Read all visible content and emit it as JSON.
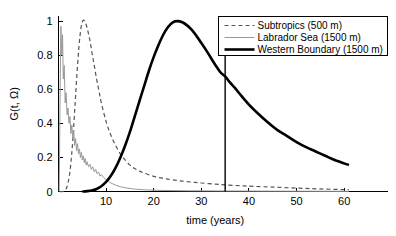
{
  "chart_data": {
    "type": "line",
    "title": "",
    "xlabel": "time (years)",
    "ylabel": "G(t, Ω)",
    "xlim": [
      0,
      65
    ],
    "ylim": [
      0,
      1.03
    ],
    "xticks": [
      10,
      20,
      30,
      40,
      50,
      60
    ],
    "xtick_labels": [
      "10",
      "20",
      "30",
      "40",
      "50",
      "60"
    ],
    "yticks": [
      0,
      0.2,
      0.4,
      0.6,
      0.8,
      1
    ],
    "ytick_labels": [
      "0",
      "0.2",
      "0.4",
      "0.6",
      "0.8",
      "1"
    ],
    "grid": false,
    "legend_position": "top-right",
    "annotations": [
      {
        "name": "vertical-marker",
        "type": "vline",
        "x": 35,
        "y_from": 0,
        "y_to": 1.03,
        "color": "#000000"
      }
    ],
    "series": [
      {
        "name": "Subtropics (500 m)",
        "style": "dashed",
        "color": "#555555",
        "width": 1.2,
        "x": [
          0.3,
          1.0,
          1.5,
          2.0,
          2.5,
          3.0,
          3.5,
          4.0,
          4.5,
          5.0,
          5.5,
          6.0,
          6.5,
          7.0,
          7.5,
          8.0,
          8.5,
          9.0,
          10.0,
          11.0,
          12.0,
          13.0,
          14.0,
          15.0,
          16.0,
          17.0,
          18.0,
          20.0,
          22.0,
          24.0,
          26.0,
          28.0,
          30.0,
          33.0,
          35.0,
          38.0,
          41.0,
          45.0,
          50.0,
          55.0,
          61.0
        ],
        "y": [
          0.0,
          0.0,
          0.01,
          0.05,
          0.14,
          0.3,
          0.52,
          0.74,
          0.91,
          0.995,
          1.0,
          0.96,
          0.9,
          0.82,
          0.74,
          0.66,
          0.59,
          0.52,
          0.41,
          0.33,
          0.27,
          0.22,
          0.185,
          0.155,
          0.135,
          0.12,
          0.108,
          0.089,
          0.077,
          0.068,
          0.061,
          0.055,
          0.05,
          0.043,
          0.039,
          0.034,
          0.03,
          0.026,
          0.02,
          0.015,
          0.01
        ]
      },
      {
        "name": "Labrador Sea (1500 m)",
        "style": "solid",
        "color": "#999999",
        "width": 1.0,
        "x": [
          0.15,
          0.35,
          0.5,
          0.7,
          0.85,
          1.0,
          1.2,
          1.4,
          1.6,
          1.8,
          2.0,
          2.2,
          2.4,
          2.6,
          2.8,
          3.0,
          3.2,
          3.4,
          3.6,
          3.8,
          4.0,
          4.2,
          4.4,
          4.6,
          4.8,
          5.0,
          5.2,
          5.4,
          5.6,
          5.8,
          6.0,
          6.3,
          6.6,
          6.9,
          7.2,
          7.5,
          7.8,
          8.1,
          8.4,
          8.7,
          9.0,
          9.5,
          10.0,
          10.5,
          11.0,
          12.0,
          13.0,
          14.0,
          16.0,
          18.0,
          22.0,
          28.0,
          35.0,
          45.0,
          61.0
        ],
        "y": [
          0.0,
          0.62,
          0.97,
          0.8,
          0.92,
          0.66,
          0.74,
          0.52,
          0.58,
          0.45,
          0.49,
          0.4,
          0.44,
          0.34,
          0.39,
          0.31,
          0.36,
          0.27,
          0.31,
          0.24,
          0.28,
          0.22,
          0.25,
          0.2,
          0.23,
          0.185,
          0.21,
          0.17,
          0.195,
          0.155,
          0.175,
          0.145,
          0.16,
          0.13,
          0.145,
          0.115,
          0.13,
          0.105,
          0.115,
          0.09,
          0.1,
          0.082,
          0.07,
          0.06,
          0.05,
          0.037,
          0.028,
          0.022,
          0.014,
          0.01,
          0.006,
          0.004,
          0.003,
          0.002,
          0.001
        ]
      },
      {
        "name": "Western Boundary (1500 m)",
        "style": "solid",
        "color": "#000000",
        "width": 2.6,
        "x": [
          5.0,
          6.0,
          7.0,
          8.0,
          9.0,
          10.0,
          11.0,
          12.0,
          13.0,
          14.0,
          15.0,
          16.0,
          17.0,
          18.0,
          19.0,
          20.0,
          21.0,
          22.0,
          23.0,
          24.0,
          25.0,
          26.0,
          27.0,
          28.0,
          29.0,
          30.0,
          31.0,
          32.0,
          33.0,
          34.0,
          35.0,
          36.0,
          37.0,
          38.0,
          40.0,
          42.0,
          44.0,
          46.0,
          48.0,
          50.0,
          52.0,
          54.0,
          56.0,
          58.0,
          61.0
        ],
        "y": [
          0.0,
          0.002,
          0.006,
          0.015,
          0.031,
          0.056,
          0.092,
          0.14,
          0.2,
          0.27,
          0.35,
          0.44,
          0.53,
          0.62,
          0.71,
          0.79,
          0.86,
          0.92,
          0.965,
          0.993,
          1.0,
          0.993,
          0.975,
          0.948,
          0.912,
          0.872,
          0.83,
          0.785,
          0.74,
          0.7,
          0.675,
          0.64,
          0.61,
          0.575,
          0.51,
          0.455,
          0.405,
          0.36,
          0.325,
          0.29,
          0.26,
          0.235,
          0.21,
          0.185,
          0.155
        ]
      }
    ]
  },
  "legend": {
    "items": [
      {
        "label": "Subtropics (500 m)",
        "swatch": "dashed-gray"
      },
      {
        "label": "Labrador Sea (1500 m)",
        "swatch": "solid-thin-gray"
      },
      {
        "label": "Western Boundary (1500 m)",
        "swatch": "solid-thick-black"
      }
    ]
  },
  "colors": {
    "subtropics": "#555555",
    "labrador": "#999999",
    "western_boundary": "#000000",
    "axis": "#000000",
    "background": "#ffffff"
  }
}
